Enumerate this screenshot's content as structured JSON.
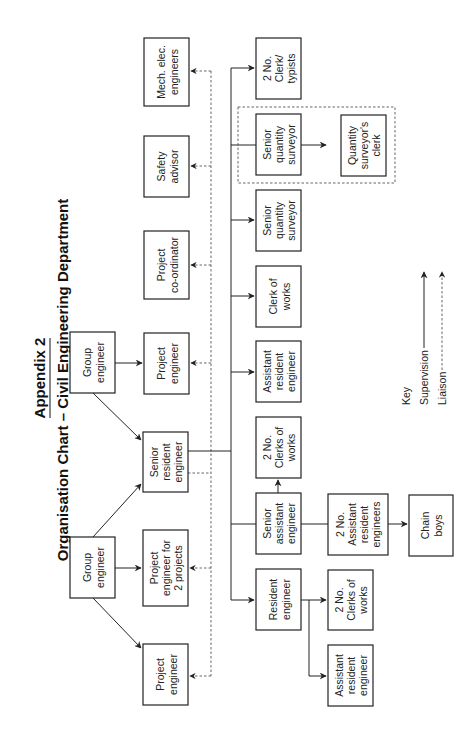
{
  "title": {
    "appendix": "Appendix 2",
    "main": "Organisation Chart  –  Civil Engineering Department"
  },
  "nodes": {
    "group_engineer_1": [
      "Group",
      "engineer"
    ],
    "group_engineer_2": [
      "Group",
      "engineer"
    ],
    "project_engineer_a": [
      "Project",
      "engineer"
    ],
    "project_engineer_2_projects": [
      "Project",
      "engineer for",
      "2 projects"
    ],
    "senior_resident_engineer": [
      "Senior",
      "resident",
      "engineer"
    ],
    "project_engineer_b": [
      "Project",
      "engineer"
    ],
    "project_coordinator": [
      "Project",
      "co-ordinator"
    ],
    "safety_advisor": [
      "Safety",
      "advisor"
    ],
    "mech_elec_engineers": [
      "Mech. elec.",
      "engineers"
    ],
    "resident_engineer": [
      "Resident",
      "engineer"
    ],
    "senior_assistant_engineer": [
      "Senior",
      "assistant",
      "engineer"
    ],
    "clerks_of_works_2_a": [
      "2 No.",
      "Clerks of",
      "works"
    ],
    "assistant_resident_engineer_a": [
      "Assistant",
      "resident",
      "engineer"
    ],
    "clerk_of_works": [
      "Clerk of",
      "works"
    ],
    "senior_quantity_surveyor_a": [
      "Senior",
      "quantity",
      "surveyor"
    ],
    "senior_quantity_surveyor_b": [
      "Senior",
      "quantity",
      "surveyor"
    ],
    "clerk_typists": [
      "2 No.",
      "Clerk/",
      "typists"
    ],
    "quantity_surveyors_clerk": [
      "Quantity",
      "surveyor's",
      "clerk"
    ],
    "assistant_resident_engineers_2": [
      "2 No.",
      "Assistant",
      "resident",
      "engineers"
    ],
    "chain_boys": [
      "Chain",
      "boys"
    ],
    "clerks_of_works_2_b": [
      "2 No.",
      "Clerks of",
      "works"
    ],
    "assistant_resident_engineer_b": [
      "Assistant",
      "resident",
      "engineer"
    ]
  },
  "key": {
    "heading": "Key",
    "supervision": "Supervision",
    "liaison": "Liaison"
  },
  "colors": {
    "line": "#222222",
    "liaison": "#555555",
    "background": "#ffffff"
  }
}
